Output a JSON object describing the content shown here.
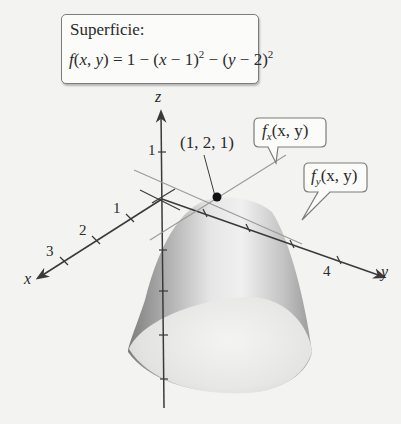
{
  "surface_callout": {
    "title": "Superficie:",
    "formula_lhs": "f(x, y)",
    "formula_rhs": "= 1 − (x − 1)² − (y − 2)²"
  },
  "point_label": "(1, 2, 1)",
  "fx_callout": {
    "fn": "f",
    "sub": "x",
    "args": "(x, y)"
  },
  "fy_callout": {
    "fn": "f",
    "sub": "y",
    "args": "(x, y)"
  },
  "axes": {
    "x": {
      "label": "x",
      "ticks": [
        "1",
        "2",
        "3"
      ]
    },
    "y": {
      "label": "y",
      "ticks": [
        "4"
      ]
    },
    "z": {
      "label": "z",
      "ticks": [
        "1"
      ]
    }
  },
  "colors": {
    "background": "#f3f3f1",
    "axis": "#3a3a3a",
    "tangent_line": "#9a9a9a",
    "surface_light": "#f2f2f2",
    "surface_dark": "#8d8d8d",
    "point": "#111111"
  }
}
